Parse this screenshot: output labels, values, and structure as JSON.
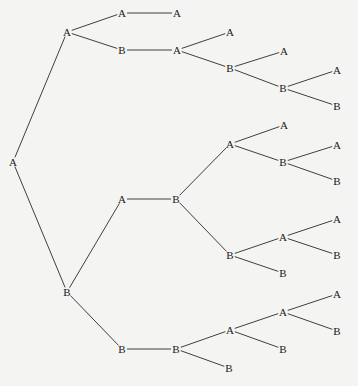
{
  "diagram": {
    "type": "tree",
    "orientation": "left-to-right",
    "background": "#f4f4f2",
    "line_color": "#2a2a2a",
    "text_color": "#1a1a1a",
    "nodes": [
      {
        "id": "n0",
        "label": "A",
        "x": 13,
        "y": 162
      },
      {
        "id": "n1",
        "label": "A",
        "x": 67,
        "y": 32
      },
      {
        "id": "n2",
        "label": "A",
        "x": 122,
        "y": 13
      },
      {
        "id": "n3",
        "label": "A",
        "x": 177,
        "y": 13
      },
      {
        "id": "n4",
        "label": "B",
        "x": 122,
        "y": 50
      },
      {
        "id": "n5",
        "label": "A",
        "x": 177,
        "y": 50
      },
      {
        "id": "n6",
        "label": "A",
        "x": 230,
        "y": 32
      },
      {
        "id": "n7",
        "label": "B",
        "x": 230,
        "y": 68
      },
      {
        "id": "n8",
        "label": "A",
        "x": 284,
        "y": 51
      },
      {
        "id": "n9",
        "label": "B",
        "x": 283,
        "y": 88
      },
      {
        "id": "n10",
        "label": "A",
        "x": 337,
        "y": 70
      },
      {
        "id": "n11",
        "label": "B",
        "x": 337,
        "y": 106
      },
      {
        "id": "n12",
        "label": "B",
        "x": 67,
        "y": 292
      },
      {
        "id": "n13",
        "label": "A",
        "x": 122,
        "y": 199
      },
      {
        "id": "n14",
        "label": "B",
        "x": 176,
        "y": 199
      },
      {
        "id": "n15",
        "label": "A",
        "x": 230,
        "y": 144
      },
      {
        "id": "n16",
        "label": "A",
        "x": 284,
        "y": 125
      },
      {
        "id": "n17",
        "label": "B",
        "x": 283,
        "y": 162
      },
      {
        "id": "n18",
        "label": "A",
        "x": 337,
        "y": 145
      },
      {
        "id": "n19",
        "label": "B",
        "x": 337,
        "y": 181
      },
      {
        "id": "n20",
        "label": "B",
        "x": 230,
        "y": 255
      },
      {
        "id": "n21",
        "label": "A",
        "x": 283,
        "y": 237
      },
      {
        "id": "n22",
        "label": "B",
        "x": 283,
        "y": 273
      },
      {
        "id": "n23",
        "label": "A",
        "x": 337,
        "y": 219
      },
      {
        "id": "n24",
        "label": "B",
        "x": 337,
        "y": 255
      },
      {
        "id": "n25",
        "label": "B",
        "x": 122,
        "y": 349
      },
      {
        "id": "n26",
        "label": "B",
        "x": 176,
        "y": 349
      },
      {
        "id": "n27",
        "label": "A",
        "x": 230,
        "y": 330
      },
      {
        "id": "n28",
        "label": "B",
        "x": 229,
        "y": 368
      },
      {
        "id": "n29",
        "label": "A",
        "x": 283,
        "y": 312
      },
      {
        "id": "n30",
        "label": "B",
        "x": 283,
        "y": 349
      },
      {
        "id": "n31",
        "label": "A",
        "x": 337,
        "y": 294
      },
      {
        "id": "n32",
        "label": "B",
        "x": 337,
        "y": 331
      }
    ],
    "edges": [
      [
        "n0",
        "n1"
      ],
      [
        "n0",
        "n12"
      ],
      [
        "n1",
        "n2"
      ],
      [
        "n1",
        "n4"
      ],
      [
        "n2",
        "n3"
      ],
      [
        "n4",
        "n5"
      ],
      [
        "n5",
        "n6"
      ],
      [
        "n5",
        "n7"
      ],
      [
        "n7",
        "n8"
      ],
      [
        "n7",
        "n9"
      ],
      [
        "n9",
        "n10"
      ],
      [
        "n9",
        "n11"
      ],
      [
        "n12",
        "n13"
      ],
      [
        "n12",
        "n25"
      ],
      [
        "n13",
        "n14"
      ],
      [
        "n14",
        "n15"
      ],
      [
        "n14",
        "n20"
      ],
      [
        "n15",
        "n16"
      ],
      [
        "n15",
        "n17"
      ],
      [
        "n17",
        "n18"
      ],
      [
        "n17",
        "n19"
      ],
      [
        "n20",
        "n21"
      ],
      [
        "n20",
        "n22"
      ],
      [
        "n21",
        "n23"
      ],
      [
        "n21",
        "n24"
      ],
      [
        "n25",
        "n26"
      ],
      [
        "n26",
        "n27"
      ],
      [
        "n26",
        "n28"
      ],
      [
        "n27",
        "n29"
      ],
      [
        "n27",
        "n30"
      ],
      [
        "n29",
        "n31"
      ],
      [
        "n29",
        "n32"
      ]
    ]
  }
}
